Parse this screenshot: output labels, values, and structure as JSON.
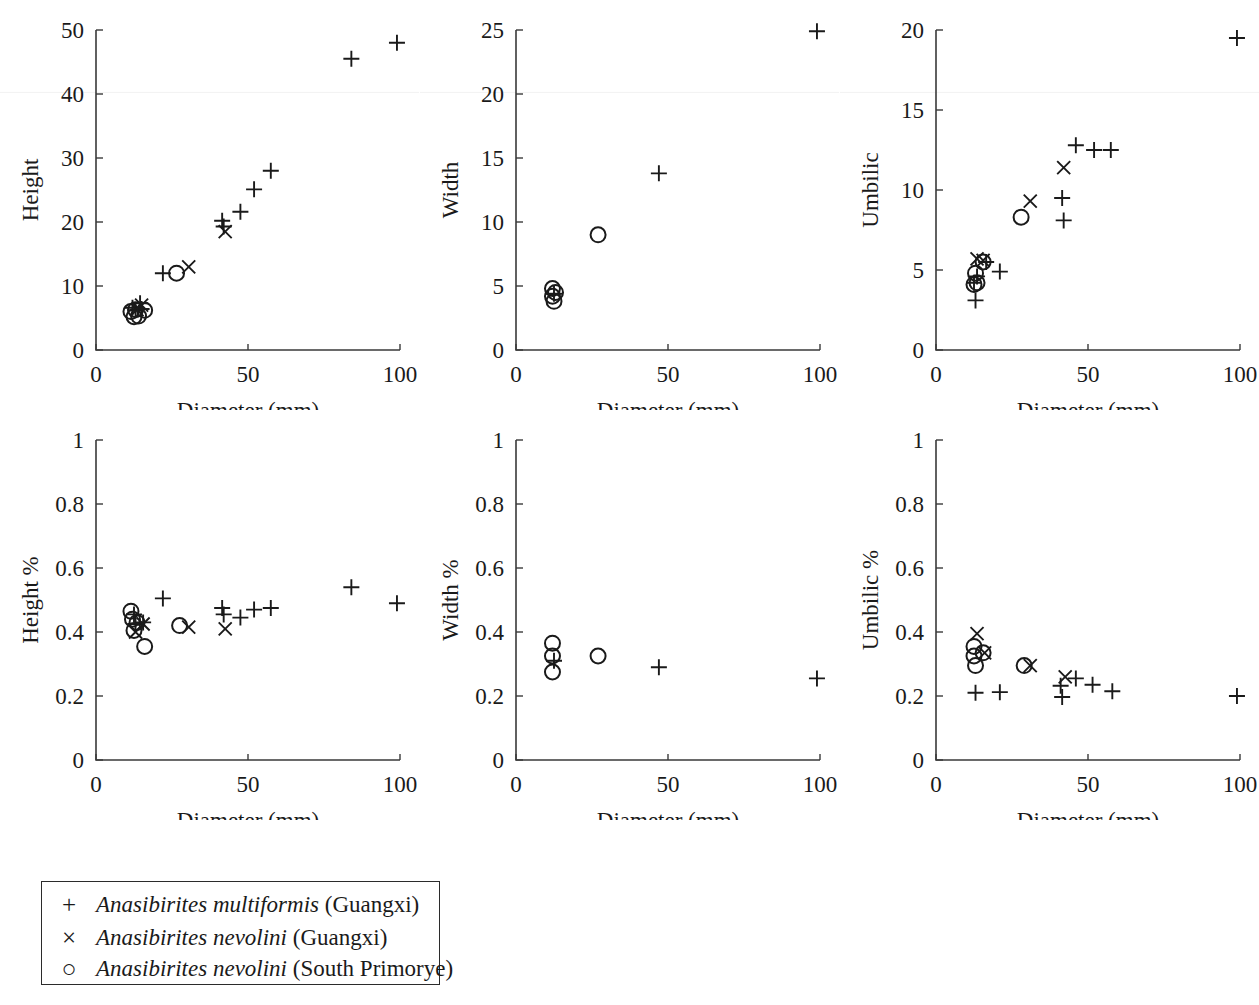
{
  "figure": {
    "shared_xlabel": "Diameter (mm)",
    "xlim": [
      0,
      100
    ],
    "xticks": [
      0,
      50,
      100
    ],
    "xtick_labels": [
      "0",
      "50",
      "100"
    ]
  },
  "legend": {
    "position": "below-left",
    "entries": [
      {
        "marker": "plus",
        "symbol": "+",
        "species": "Anasibirites multiformis",
        "locality": "(Guangxi)"
      },
      {
        "marker": "cross",
        "symbol": "×",
        "species": "Anasibirites nevolini",
        "locality": "(Guangxi)"
      },
      {
        "marker": "circle",
        "symbol": "○",
        "species": "Anasibirites nevolini",
        "locality": "(South Primorye)"
      }
    ]
  },
  "chart_data": [
    {
      "id": "height-vs-diameter",
      "type": "scatter",
      "title": "",
      "xlabel": "Diameter (mm)",
      "ylabel": "Height",
      "xlim": [
        0,
        100
      ],
      "ylim": [
        0,
        50
      ],
      "xticks": [
        0,
        50,
        100
      ],
      "yticks": [
        0,
        10,
        20,
        30,
        40,
        50
      ],
      "ytick_labels": [
        "0",
        "10",
        "20",
        "30",
        "40",
        "50"
      ],
      "grid": false,
      "series": [
        {
          "name": "Anasibirites multiformis (Guangxi)",
          "marker": "plus",
          "points": [
            [
              12.0,
              6.6
            ],
            [
              13.0,
              6.2
            ],
            [
              14.5,
              7.3
            ],
            [
              15.0,
              6.4
            ],
            [
              22.0,
              12.0
            ],
            [
              41.5,
              20.2
            ],
            [
              42.0,
              19.3
            ],
            [
              47.5,
              21.6
            ],
            [
              52.0,
              25.1
            ],
            [
              57.5,
              28.0
            ],
            [
              84.0,
              45.5
            ],
            [
              99.0,
              48.0
            ]
          ]
        },
        {
          "name": "Anasibirites nevolini (Guangxi)",
          "marker": "cross",
          "points": [
            [
              13.5,
              6.3
            ],
            [
              15.0,
              7.0
            ],
            [
              30.5,
              13.0
            ],
            [
              42.5,
              18.5
            ]
          ]
        },
        {
          "name": "Anasibirites nevolini (South Primorye)",
          "marker": "circle",
          "points": [
            [
              11.5,
              6.0
            ],
            [
              12.5,
              5.2
            ],
            [
              13.0,
              6.3
            ],
            [
              14.0,
              5.3
            ],
            [
              16.0,
              6.2
            ],
            [
              26.5,
              12.0
            ]
          ]
        }
      ]
    },
    {
      "id": "width-vs-diameter",
      "type": "scatter",
      "title": "",
      "xlabel": "Diameter (mm)",
      "ylabel": "Width",
      "xlim": [
        0,
        100
      ],
      "ylim": [
        0,
        25
      ],
      "xticks": [
        0,
        50,
        100
      ],
      "yticks": [
        0,
        5,
        10,
        15,
        20,
        25
      ],
      "ytick_labels": [
        "0",
        "5",
        "10",
        "15",
        "20",
        "25"
      ],
      "grid": false,
      "series": [
        {
          "name": "Anasibirites multiformis (Guangxi)",
          "marker": "plus",
          "points": [
            [
              12.5,
              4.4
            ],
            [
              47.0,
              13.8
            ],
            [
              99.0,
              24.9
            ]
          ]
        },
        {
          "name": "Anasibirites nevolini (Guangxi)",
          "marker": "cross",
          "points": []
        },
        {
          "name": "Anasibirites nevolini (South Primorye)",
          "marker": "circle",
          "points": [
            [
              12.0,
              4.8
            ],
            [
              12.0,
              4.2
            ],
            [
              12.5,
              3.8
            ],
            [
              13.0,
              4.5
            ],
            [
              27.0,
              9.0
            ]
          ]
        }
      ]
    },
    {
      "id": "umbilic-vs-diameter",
      "type": "scatter",
      "title": "",
      "xlabel": "Diameter (mm)",
      "ylabel": "Umbilic",
      "xlim": [
        0,
        100
      ],
      "ylim": [
        0,
        20
      ],
      "xticks": [
        0,
        50,
        100
      ],
      "yticks": [
        0,
        5,
        10,
        15,
        20
      ],
      "ytick_labels": [
        "0",
        "5",
        "10",
        "15",
        "20"
      ],
      "grid": false,
      "series": [
        {
          "name": "Anasibirites multiformis (Guangxi)",
          "marker": "plus",
          "points": [
            [
              12.5,
              4.2
            ],
            [
              13.0,
              3.1
            ],
            [
              13.5,
              4.6
            ],
            [
              16.5,
              5.5
            ],
            [
              21.0,
              4.9
            ],
            [
              41.5,
              9.5
            ],
            [
              42.0,
              8.1
            ],
            [
              46.0,
              12.8
            ],
            [
              52.0,
              12.5
            ],
            [
              57.5,
              12.5
            ],
            [
              99.0,
              19.5
            ]
          ]
        },
        {
          "name": "Anasibirites nevolini (Guangxi)",
          "marker": "cross",
          "points": [
            [
              13.5,
              5.7
            ],
            [
              15.5,
              5.6
            ],
            [
              31.0,
              9.3
            ],
            [
              42.0,
              11.4
            ]
          ]
        },
        {
          "name": "Anasibirites nevolini (South Primorye)",
          "marker": "circle",
          "points": [
            [
              12.5,
              4.1
            ],
            [
              13.0,
              4.8
            ],
            [
              13.5,
              4.2
            ],
            [
              15.5,
              5.5
            ],
            [
              28.0,
              8.3
            ]
          ]
        }
      ]
    },
    {
      "id": "height-percent-vs-diameter",
      "type": "scatter",
      "title": "",
      "xlabel": "Diameter (mm)",
      "ylabel": "Height %",
      "xlim": [
        0,
        100
      ],
      "ylim": [
        0,
        1
      ],
      "xticks": [
        0,
        50,
        100
      ],
      "yticks": [
        0,
        0.2,
        0.4,
        0.6,
        0.8,
        1
      ],
      "ytick_labels": [
        "0",
        "0.2",
        "0.4",
        "0.6",
        "0.8",
        "1"
      ],
      "grid": false,
      "series": [
        {
          "name": "Anasibirites multiformis (Guangxi)",
          "marker": "plus",
          "points": [
            [
              12.5,
              0.455
            ],
            [
              13.0,
              0.425
            ],
            [
              15.5,
              0.43
            ],
            [
              22.0,
              0.505
            ],
            [
              41.5,
              0.475
            ],
            [
              42.0,
              0.455
            ],
            [
              47.5,
              0.445
            ],
            [
              52.0,
              0.47
            ],
            [
              57.5,
              0.475
            ],
            [
              84.0,
              0.54
            ],
            [
              99.0,
              0.49
            ]
          ]
        },
        {
          "name": "Anasibirites nevolini (Guangxi)",
          "marker": "cross",
          "points": [
            [
              13.0,
              0.4
            ],
            [
              15.5,
              0.425
            ],
            [
              30.5,
              0.415
            ],
            [
              42.5,
              0.41
            ]
          ]
        },
        {
          "name": "Anasibirites nevolini (South Primorye)",
          "marker": "circle",
          "points": [
            [
              11.5,
              0.465
            ],
            [
              12.0,
              0.44
            ],
            [
              12.5,
              0.405
            ],
            [
              13.5,
              0.43
            ],
            [
              16.0,
              0.355
            ],
            [
              27.5,
              0.42
            ]
          ]
        }
      ]
    },
    {
      "id": "width-percent-vs-diameter",
      "type": "scatter",
      "title": "",
      "xlabel": "Diameter (mm)",
      "ylabel": "Width %",
      "xlim": [
        0,
        100
      ],
      "ylim": [
        0,
        1
      ],
      "xticks": [
        0,
        50,
        100
      ],
      "yticks": [
        0,
        0.2,
        0.4,
        0.6,
        0.8,
        1
      ],
      "ytick_labels": [
        "0",
        "0.2",
        "0.4",
        "0.6",
        "0.8",
        "1"
      ],
      "grid": false,
      "series": [
        {
          "name": "Anasibirites multiformis (Guangxi)",
          "marker": "plus",
          "points": [
            [
              12.5,
              0.31
            ],
            [
              47.0,
              0.29
            ],
            [
              99.0,
              0.255
            ]
          ]
        },
        {
          "name": "Anasibirites nevolini (Guangxi)",
          "marker": "cross",
          "points": []
        },
        {
          "name": "Anasibirites nevolini (South Primorye)",
          "marker": "circle",
          "points": [
            [
              12.0,
              0.365
            ],
            [
              12.0,
              0.325
            ],
            [
              12.0,
              0.275
            ],
            [
              27.0,
              0.325
            ]
          ]
        }
      ]
    },
    {
      "id": "umbilic-percent-vs-diameter",
      "type": "scatter",
      "title": "",
      "xlabel": "Diameter (mm)",
      "ylabel": "Umbilic %",
      "xlim": [
        0,
        100
      ],
      "ylim": [
        0,
        1
      ],
      "xticks": [
        0,
        50,
        100
      ],
      "yticks": [
        0,
        0.2,
        0.4,
        0.6,
        0.8,
        1
      ],
      "ytick_labels": [
        "0",
        "0.2",
        "0.4",
        "0.6",
        "0.8",
        "1"
      ],
      "grid": false,
      "series": [
        {
          "name": "Anasibirites multiformis (Guangxi)",
          "marker": "plus",
          "points": [
            [
              13.0,
              0.21
            ],
            [
              21.0,
              0.212
            ],
            [
              41.0,
              0.232
            ],
            [
              41.5,
              0.197
            ],
            [
              46.0,
              0.255
            ],
            [
              51.5,
              0.235
            ],
            [
              58.0,
              0.215
            ],
            [
              99.0,
              0.2
            ]
          ]
        },
        {
          "name": "Anasibirites nevolini (Guangxi)",
          "marker": "cross",
          "points": [
            [
              13.5,
              0.395
            ],
            [
              16.0,
              0.335
            ],
            [
              31.0,
              0.295
            ],
            [
              42.5,
              0.26
            ]
          ]
        },
        {
          "name": "Anasibirites nevolini (South Primorye)",
          "marker": "circle",
          "points": [
            [
              12.5,
              0.355
            ],
            [
              12.5,
              0.325
            ],
            [
              13.0,
              0.295
            ],
            [
              15.5,
              0.335
            ],
            [
              29.0,
              0.295
            ]
          ]
        }
      ]
    }
  ]
}
